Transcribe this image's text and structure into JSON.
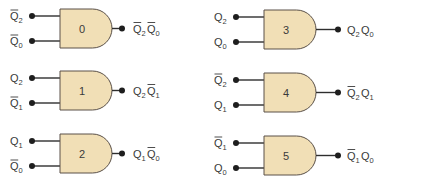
{
  "colors": {
    "gate_fill": "#f1dfb6",
    "gate_stroke": "#5a5048",
    "wire": "#2e2e2e",
    "text": "#3a3a3a"
  },
  "gates": [
    {
      "number": "0",
      "inputs": [
        {
          "var": "Q",
          "sub": "2",
          "complemented": true
        },
        {
          "var": "Q",
          "sub": "0",
          "complemented": true
        }
      ],
      "output": [
        {
          "var": "Q",
          "sub": "2",
          "complemented": true
        },
        {
          "var": "Q",
          "sub": "0",
          "complemented": true
        }
      ]
    },
    {
      "number": "1",
      "inputs": [
        {
          "var": "Q",
          "sub": "2",
          "complemented": false
        },
        {
          "var": "Q",
          "sub": "1",
          "complemented": true
        }
      ],
      "output": [
        {
          "var": "Q",
          "sub": "2",
          "complemented": false
        },
        {
          "var": "Q",
          "sub": "1",
          "complemented": true
        }
      ]
    },
    {
      "number": "2",
      "inputs": [
        {
          "var": "Q",
          "sub": "1",
          "complemented": false
        },
        {
          "var": "Q",
          "sub": "0",
          "complemented": true
        }
      ],
      "output": [
        {
          "var": "Q",
          "sub": "1",
          "complemented": false
        },
        {
          "var": "Q",
          "sub": "0",
          "complemented": true
        }
      ]
    },
    {
      "number": "3",
      "inputs": [
        {
          "var": "Q",
          "sub": "2",
          "complemented": false
        },
        {
          "var": "Q",
          "sub": "0",
          "complemented": false
        }
      ],
      "output": [
        {
          "var": "Q",
          "sub": "2",
          "complemented": false
        },
        {
          "var": "Q",
          "sub": "0",
          "complemented": false
        }
      ]
    },
    {
      "number": "4",
      "inputs": [
        {
          "var": "Q",
          "sub": "2",
          "complemented": true
        },
        {
          "var": "Q",
          "sub": "1",
          "complemented": false
        }
      ],
      "output": [
        {
          "var": "Q",
          "sub": "2",
          "complemented": true
        },
        {
          "var": "Q",
          "sub": "1",
          "complemented": false
        }
      ]
    },
    {
      "number": "5",
      "inputs": [
        {
          "var": "Q",
          "sub": "1",
          "complemented": true
        },
        {
          "var": "Q",
          "sub": "0",
          "complemented": false
        }
      ],
      "output": [
        {
          "var": "Q",
          "sub": "1",
          "complemented": true
        },
        {
          "var": "Q",
          "sub": "0",
          "complemented": false
        }
      ]
    }
  ]
}
